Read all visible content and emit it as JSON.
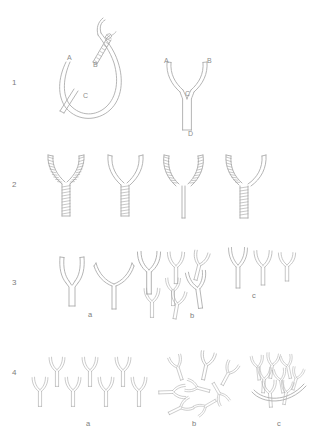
{
  "figure": {
    "type": "scientific-line-diagram",
    "background_color": "#ffffff",
    "line_color": "#a8a8a8",
    "label_color": "#7d7d7d"
  },
  "rows": [
    {
      "number": "1",
      "label": "1",
      "caption": "",
      "panels": [
        {
          "id": "1-left",
          "description": "curved vessel loop with branch segment sutured at anastomosis",
          "point_labels": [
            {
              "text": "A",
              "x": 67,
              "y": 54
            },
            {
              "text": "B",
              "x": 93,
              "y": 61
            },
            {
              "text": "C",
              "x": 83,
              "y": 92
            }
          ]
        },
        {
          "id": "1-right",
          "description": "completed Y-shaped graft with two arms and a single stem",
          "point_labels": [
            {
              "text": "A",
              "x": 164,
              "y": 57
            },
            {
              "text": "B",
              "x": 207,
              "y": 57
            },
            {
              "text": "C",
              "x": 186,
              "y": 90
            },
            {
              "text": "D",
              "x": 188,
              "y": 130
            }
          ]
        }
      ]
    },
    {
      "number": "2",
      "label": "2",
      "caption": "",
      "panels": [
        {
          "id": "2-a",
          "description": "both arms and stem wrapped/sutured",
          "hatched": [
            "left-arm",
            "right-arm",
            "stem"
          ]
        },
        {
          "id": "2-b",
          "description": "plain arms, wrapped stem",
          "hatched": [
            "stem"
          ]
        },
        {
          "id": "2-c",
          "description": "wrapped arms, plain stem",
          "hatched": [
            "left-arm",
            "right-arm"
          ]
        },
        {
          "id": "2-d",
          "description": "left arm and stem wrapped, right arm plain",
          "hatched": [
            "left-arm",
            "stem"
          ]
        }
      ]
    },
    {
      "number": "3",
      "label": "3",
      "caption": "",
      "panels": [
        {
          "id": "3-a",
          "label": "a",
          "label_x": 88,
          "label_y": 311,
          "description": "two large Y units, narrow and wide arm angle"
        },
        {
          "id": "3-b",
          "label": "b",
          "label_x": 190,
          "label_y": 312,
          "description": "seven Y units of assorted sizes and orientations"
        },
        {
          "id": "3-c",
          "label": "c",
          "label_x": 252,
          "label_y": 292,
          "description": "three Y units of decreasing stem length in a row"
        }
      ]
    },
    {
      "number": "4",
      "label": "4",
      "caption": "",
      "panels": [
        {
          "id": "4-a",
          "label": "a",
          "label_x": 86,
          "label_y": 420,
          "description": "regular tessellated lattice network of Y units"
        },
        {
          "id": "4-b",
          "label": "b",
          "label_x": 192,
          "label_y": 420,
          "description": "irregular tangled network of randomly oriented Y units"
        },
        {
          "id": "4-c",
          "label": "c",
          "label_x": 277,
          "label_y": 420,
          "description": "dense overlapping clustered network of Y units"
        }
      ]
    }
  ]
}
